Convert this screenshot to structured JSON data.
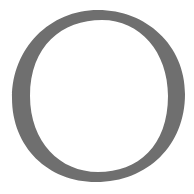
{
  "glyph": {
    "character": "O",
    "fill_color": "#6f6f6f",
    "background_color": "#ffffff"
  }
}
